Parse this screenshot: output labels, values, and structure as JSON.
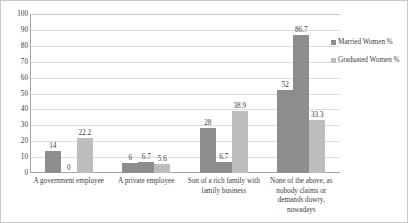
{
  "chart_data": {
    "type": "bar",
    "title": "",
    "xlabel": "",
    "ylabel": "",
    "ylim": [
      0,
      100
    ],
    "ytick_step": 10,
    "grid": true,
    "legend_position": "right",
    "categories": [
      "A government employee",
      "A private employee",
      "Son of a rich family with family business",
      "None of the above, as nobody claims or demands dowry, nowadays"
    ],
    "yticks": [
      "100",
      "90",
      "80",
      "70",
      "60",
      "50",
      "40",
      "30",
      "20",
      "10",
      "0"
    ],
    "series": [
      {
        "name": "Married Women %",
        "color": "#8d8d8d",
        "values": [
          14,
          6,
          28,
          52
        ],
        "labels": [
          "14",
          "6",
          "28",
          "52"
        ]
      },
      {
        "name": "Graduated Women %",
        "color": "#bdbdbd",
        "values": [
          22.2,
          5.6,
          38.9,
          33.3
        ],
        "labels": [
          "22.2",
          "5.6",
          "38.9",
          "33.3"
        ]
      }
    ],
    "mid_labels": [
      "0",
      "6.7",
      "6.7",
      "86.7"
    ],
    "mid_values": [
      0,
      6.7,
      6.7,
      86.7
    ]
  },
  "legend": {
    "items": [
      {
        "label": "Married Women %"
      },
      {
        "label": "Graduated Women %"
      }
    ]
  }
}
